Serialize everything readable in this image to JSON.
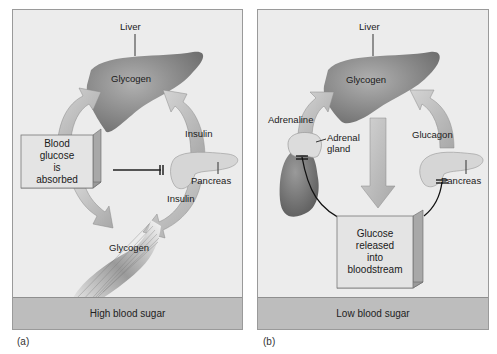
{
  "panels": {
    "a": {
      "caption": "(a)",
      "footer": "High blood sugar",
      "labels": {
        "liver": "Liver",
        "liver_glycogen": "Glycogen",
        "insulin_top": "Insulin",
        "pancreas": "Pancreas",
        "insulin_bottom": "Insulin",
        "muscle_glycogen": "Glycogen"
      },
      "box": [
        "Blood",
        "glucose",
        "is",
        "absorbed"
      ]
    },
    "b": {
      "caption": "(b)",
      "footer": "Low blood sugar",
      "labels": {
        "liver": "Liver",
        "liver_glycogen": "Glycogen",
        "adrenaline": "Adrenaline",
        "adrenal_gland_1": "Adrenal",
        "adrenal_gland_2": "gland",
        "glucagon": "Glucagon",
        "pancreas": "Pancreas"
      },
      "box": [
        "Glucose",
        "released",
        "into",
        "bloodstream"
      ]
    }
  },
  "colors": {
    "panel_bg": "#ececec",
    "footer_bg": "#bdbdbd",
    "liver": "#8a8a8a",
    "arrow": "#b8b8b8",
    "box_face": "#e6e6e6"
  }
}
